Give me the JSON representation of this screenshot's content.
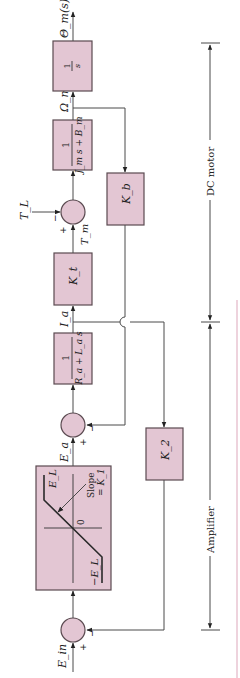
{
  "diagram": {
    "orientation": "rotated-ccw",
    "colors": {
      "block_fill": "#e3c6d3",
      "block_stroke": "#5a4a50",
      "line": "#4a4a4a",
      "accent_rule": "#e8c4d2"
    },
    "signals": {
      "input": "E_in",
      "amp_out": "E_a",
      "current": "I_a",
      "motor_torque": "T_m",
      "load_torque": "T_L",
      "speed": "Ω_m",
      "output": "Θ_m(s)"
    },
    "blocks": {
      "integrator": {
        "num": "1",
        "den": "s"
      },
      "mechanical": {
        "num": "1",
        "den": "J_m s + B_m"
      },
      "torque_const": {
        "label": "K_t"
      },
      "back_emf": {
        "label": "K_b"
      },
      "electrical": {
        "num": "1",
        "den": "R_a + L_a s"
      },
      "current_fb": {
        "label": "K_2"
      },
      "saturation": {
        "upper": "E_L",
        "lower": "−E_L",
        "origin": "0",
        "slope_line1": "Slope",
        "slope_line2": "= K_1"
      }
    },
    "summing_junctions": {
      "torque": {
        "plus": "+",
        "minus": "−"
      },
      "voltage": {
        "plus": "+",
        "minus": "−"
      },
      "input": {
        "plus": "+",
        "minus": "−"
      }
    },
    "dimension_labels": {
      "motor": "DC motor",
      "amplifier": "Amplifier"
    }
  }
}
